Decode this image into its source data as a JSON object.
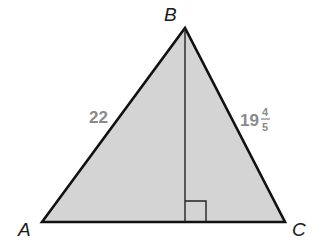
{
  "diagram": {
    "type": "triangle-with-altitude",
    "vertices": {
      "A": {
        "label": "A",
        "x": 42,
        "y": 222
      },
      "B": {
        "label": "B",
        "x": 185,
        "y": 28
      },
      "C": {
        "label": "C",
        "x": 285,
        "y": 222
      }
    },
    "sides": {
      "AB": {
        "label": "22"
      },
      "BC": {
        "whole": "19",
        "numerator": "4",
        "denominator": "5"
      }
    },
    "altitude": {
      "from": "B",
      "to_side": "AC",
      "right_angle_marker": true
    },
    "colors": {
      "fill": "#d4d4d4",
      "stroke": "#111111",
      "side_label": "#8a8a8a"
    }
  }
}
